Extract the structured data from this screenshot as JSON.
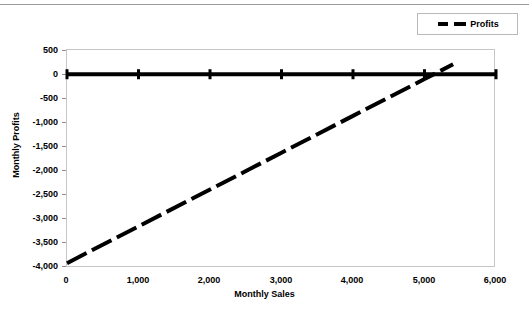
{
  "chart_data": {
    "type": "line",
    "title": "",
    "xlabel": "Monthly Sales",
    "ylabel": "Monthly Profits",
    "xlim": [
      0,
      6000
    ],
    "ylim": [
      -4000,
      500
    ],
    "xticks": [
      "0",
      "1,000",
      "2,000",
      "3,000",
      "4,000",
      "5,000",
      "6,000"
    ],
    "xtick_values": [
      0,
      1000,
      2000,
      3000,
      4000,
      5000,
      6000
    ],
    "yticks": [
      "500",
      "0",
      "-500",
      "-1,000",
      "-1,500",
      "-2,000",
      "-2,500",
      "-3,000",
      "-3,500",
      "-4,000"
    ],
    "ytick_values": [
      500,
      0,
      -500,
      -1000,
      -1500,
      -2000,
      -2500,
      -3000,
      -3500,
      -4000
    ],
    "grid": false,
    "legend_position": "top-right",
    "series": [
      {
        "name": "Zero Reference",
        "style": "solid",
        "color": "#000000",
        "width": 4,
        "marker": "tick",
        "in_legend": false,
        "x": [
          0,
          1000,
          2000,
          3000,
          4000,
          5000,
          6000
        ],
        "values": [
          0,
          0,
          0,
          0,
          0,
          0,
          0
        ]
      },
      {
        "name": "Profits",
        "style": "dashed",
        "color": "#000000",
        "width": 4,
        "marker": "none",
        "in_legend": true,
        "x": [
          0,
          1000,
          2000,
          3000,
          4000,
          5000,
          5400
        ],
        "values": [
          -3900,
          -3140,
          -2380,
          -1620,
          -860,
          -100,
          205
        ]
      }
    ]
  },
  "legend": {
    "entries": [
      {
        "label": "Profits"
      }
    ]
  },
  "axes": {
    "x_title": "Monthly Sales",
    "y_title": "Monthly Profits"
  }
}
